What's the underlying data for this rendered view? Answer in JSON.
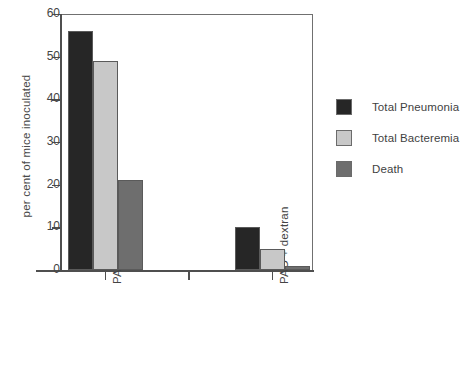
{
  "chart_data": {
    "type": "bar",
    "title": "",
    "xlabel": "",
    "ylabel": "per cent of mice inoculated",
    "categories": [
      "PAO control",
      "PAO + dextran"
    ],
    "series": [
      {
        "name": "Total Pneumonia",
        "values": [
          56,
          10
        ],
        "color": "#262626"
      },
      {
        "name": "Total Bacteremia",
        "values": [
          49,
          5
        ],
        "color": "#c8c8c8"
      },
      {
        "name": "Death",
        "values": [
          21,
          1
        ],
        "color": "#6e6e6e"
      }
    ],
    "ylim": [
      0,
      60
    ],
    "yticks": [
      0,
      10,
      20,
      30,
      40,
      50,
      60
    ],
    "ytick_labels": [
      "0",
      "10",
      "20",
      "30",
      "40",
      "50",
      "60"
    ],
    "grid": false,
    "legend_position": "right",
    "axis_color": "#4f4f4f",
    "frame_color": "#707070",
    "bar_edge_color": "#5a5a5a",
    "background": "#ffffff"
  },
  "legend": {
    "items": [
      {
        "label": "Total Pneumonia"
      },
      {
        "label": "Total Bacteremia"
      },
      {
        "label": "Death"
      }
    ]
  },
  "axes": {
    "y_title": "per cent of mice inoculated",
    "y_labels": [
      "60",
      "50",
      "40",
      "30",
      "20",
      "10",
      "0"
    ],
    "x_labels": [
      "PAO control",
      "PAO + dextran"
    ]
  }
}
